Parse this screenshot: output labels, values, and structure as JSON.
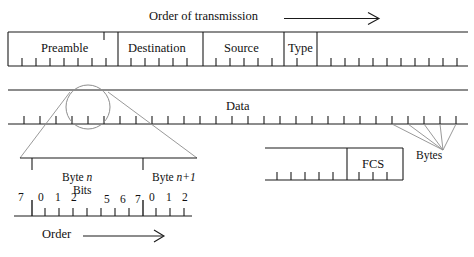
{
  "figure": {
    "type": "diagram",
    "stroke_color": "#1a1a1a",
    "thin_color": "#8d8d8d",
    "background": "#ffffff"
  },
  "transmission": {
    "label": "Order of transmission",
    "arrow_icon": "right-arrow-icon"
  },
  "frame": {
    "caption": "Ethernet frame fields",
    "fields": [
      {
        "name": "preamble",
        "label": "Preamble"
      },
      {
        "name": "destination",
        "label": "Destination"
      },
      {
        "name": "source",
        "label": "Source"
      },
      {
        "name": "type",
        "label": "Type"
      }
    ]
  },
  "data_row": {
    "label": "Data",
    "magnifier_icon": "magnifier-circle-icon"
  },
  "tail_row": {
    "label": "FCS"
  },
  "bytes_callout": {
    "label": "Bytes"
  },
  "byte_detail": {
    "byte_n_label": "Byte",
    "byte_n_index": "n",
    "byte_next_label": "Byte",
    "byte_next_index": "n+1",
    "bits_label": "Bits",
    "bit_numbers": [
      "7",
      "0",
      "1",
      "2",
      "5",
      "6",
      "7",
      "0",
      "1",
      "2"
    ],
    "order_label": "Order",
    "order_arrow_icon": "right-arrow-icon"
  }
}
